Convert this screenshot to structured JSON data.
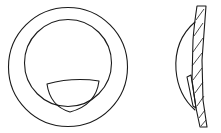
{
  "diagram": {
    "views": [
      {
        "name": "front-view",
        "parts": [
          "outer-ring",
          "inner-lens-circle",
          "segment-insert"
        ]
      },
      {
        "name": "side-section-view",
        "parts": [
          "lens-body-section",
          "hatched-section",
          "segment-insert-section"
        ]
      }
    ],
    "colors": {
      "line": "#1a1a1a",
      "background": "#ffffff"
    }
  }
}
